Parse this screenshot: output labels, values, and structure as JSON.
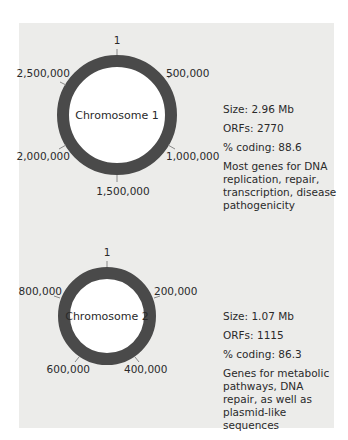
{
  "chromosomes": [
    {
      "name": "Chromosome 1",
      "ticks": [
        "1",
        "500,000",
        "1,000,000",
        "1,500,000",
        "2,000,000",
        "2,500,000"
      ],
      "size": "Size: 2.96 Mb",
      "orfs": "ORFs: 2770",
      "coding": "% coding: 88.6",
      "description": "Most genes for DNA replication, repair, transcription, disease pathogenicity"
    },
    {
      "name": "Chromosome 2",
      "ticks": [
        "1",
        "200,000",
        "400,000",
        "600,000",
        "800,000"
      ],
      "size": "Size: 1.07 Mb",
      "orfs": "ORFs: 1115",
      "coding": "% coding: 86.3",
      "description": "Genes for metabolic pathways, DNA repair, as well as plasmid-like sequences"
    }
  ],
  "colors": {
    "panel": "#ececea",
    "ring": "#4a4a4a",
    "text": "#2a2a2a"
  }
}
